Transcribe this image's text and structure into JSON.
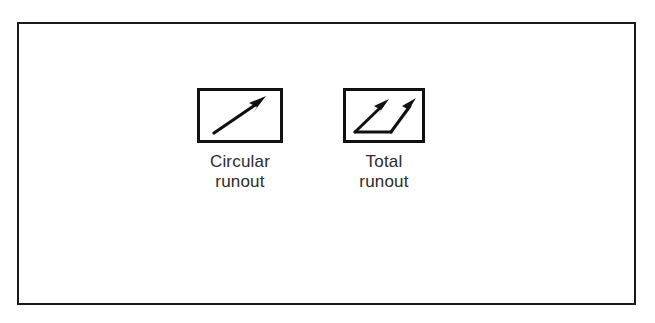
{
  "figure": {
    "background_color": "#ffffff",
    "frame_color": "#1a1a1a",
    "symbol_color": "#111111",
    "caption_color": "#2b2b2b",
    "symbols": [
      {
        "id": "circular-runout",
        "icon_name": "circular-runout-symbol-icon",
        "caption": "Circular\nrunout",
        "caption_line_1": "Circular",
        "caption_line_2": "runout",
        "arrow_count": 1,
        "has_baseline": false
      },
      {
        "id": "total-runout",
        "icon_name": "total-runout-symbol-icon",
        "caption": "Total\nrunout",
        "caption_line_1": "Total",
        "caption_line_2": "runout",
        "arrow_count": 2,
        "has_baseline": true
      }
    ]
  }
}
